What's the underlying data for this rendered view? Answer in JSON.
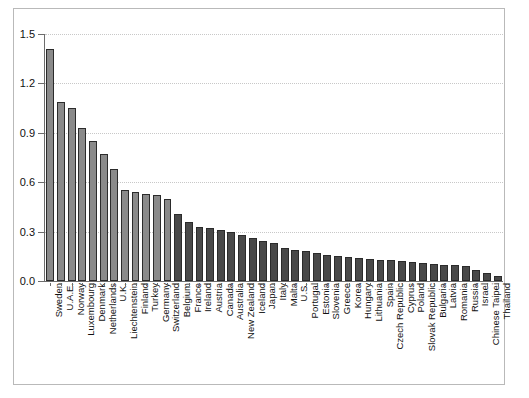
{
  "chart_data": {
    "type": "bar",
    "title": "",
    "subtitle": "",
    "xlabel": "",
    "ylabel": "",
    "ylim": [
      0.0,
      1.5
    ],
    "yticks": [
      "0.0",
      "0.3",
      "0.6",
      "0.9",
      "1.2",
      "1.5"
    ],
    "ytick_values": [
      0.0,
      0.3,
      0.6,
      0.9,
      1.2,
      1.5
    ],
    "grid": "horizontal-dotted",
    "legend": "none",
    "orientation": "vertical",
    "categories": [
      "Sweden",
      "U.A.E.",
      "Norway",
      "Luxembourg",
      "Denmark",
      "Netherlands",
      "U.K.",
      "Liechtenstein",
      "Finland",
      "Turkey",
      "Germany",
      "Switzerland",
      "Belgium",
      "France",
      "Ireland",
      "Austria",
      "Canada",
      "Australia",
      "New Zealand",
      "Iceland",
      "Japan",
      "Italy",
      "Malta",
      "U.S.",
      "Portugal",
      "Estonia",
      "Slovenia",
      "Greece",
      "Korea",
      "Hungary",
      "Lithuania",
      "Spain",
      "Czech Republic",
      "Cyprus",
      "Poland",
      "Slovak Republic",
      "Bulgaria",
      "Latvia",
      "Romania",
      "Russia",
      "Israel",
      "Chinese Taipei",
      "Thailand"
    ],
    "values": [
      1.41,
      1.09,
      1.05,
      0.93,
      0.85,
      0.77,
      0.68,
      0.55,
      0.54,
      0.53,
      0.52,
      0.5,
      0.41,
      0.36,
      0.33,
      0.32,
      0.31,
      0.3,
      0.28,
      0.26,
      0.24,
      0.23,
      0.2,
      0.19,
      0.18,
      0.17,
      0.16,
      0.15,
      0.145,
      0.14,
      0.135,
      0.13,
      0.125,
      0.12,
      0.115,
      0.11,
      0.105,
      0.1,
      0.095,
      0.09,
      0.065,
      0.05,
      0.03
    ],
    "colors": {
      "bar_light": "#8a8a8a",
      "bar_dark": "#494949",
      "bar_edge": "#2b2b2b",
      "axis": "#6d6d6d",
      "grid": "#c8c8c8",
      "frame": "#b9b9b9",
      "text": "#111111",
      "background": "#ffffff"
    },
    "light_bar_count": 12
  }
}
